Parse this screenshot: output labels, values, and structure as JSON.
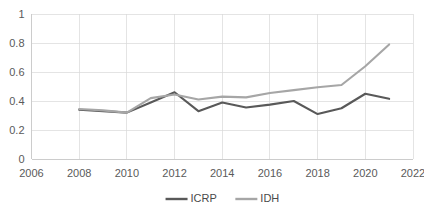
{
  "chart_data": {
    "type": "line",
    "title": "",
    "xlabel": "",
    "ylabel": "",
    "x": [
      2008,
      2009,
      2010,
      2011,
      2012,
      2013,
      2014,
      2015,
      2016,
      2017,
      2018,
      2019,
      2020,
      2021
    ],
    "xlim": [
      2006,
      2022
    ],
    "ylim": [
      0,
      1
    ],
    "grid": true,
    "legend_position": "bottom",
    "xticks": [
      "2006",
      "2008",
      "2010",
      "2012",
      "2014",
      "2016",
      "2018",
      "2020",
      "2022"
    ],
    "xtick_values": [
      2006,
      2008,
      2010,
      2012,
      2014,
      2016,
      2018,
      2020,
      2022
    ],
    "yticks": [
      "0",
      "0.2",
      "0.4",
      "0.6",
      "0.8",
      "1"
    ],
    "ytick_values": [
      0,
      0.2,
      0.4,
      0.6,
      0.8,
      1
    ],
    "series": [
      {
        "name": "ICRP",
        "color": "#595959",
        "values": [
          0.34,
          0.33,
          0.32,
          0.39,
          0.46,
          0.33,
          0.39,
          0.355,
          0.375,
          0.4,
          0.31,
          0.35,
          0.45,
          0.415
        ]
      },
      {
        "name": "IDH",
        "color": "#a6a6a6",
        "values": [
          0.345,
          0.335,
          0.32,
          0.42,
          0.445,
          0.41,
          0.43,
          0.425,
          0.455,
          0.475,
          0.495,
          0.51,
          0.64,
          0.79
        ]
      }
    ]
  },
  "legend": {
    "items": [
      {
        "label": "ICRP",
        "color": "#595959"
      },
      {
        "label": "IDH",
        "color": "#a6a6a6"
      }
    ]
  }
}
